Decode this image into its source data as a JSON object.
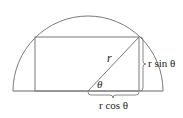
{
  "diagram": {
    "colors": {
      "stroke": "#7a7a7a",
      "text": "#222222",
      "background": "#ffffff"
    },
    "labels": {
      "radius": "r",
      "angle": "θ",
      "height": "r sin θ",
      "half_width": "r cos θ"
    },
    "geometry": {
      "semicircle_center": [
        88,
        91
      ],
      "semicircle_radius": 75,
      "rect": {
        "left": 35,
        "right": 139,
        "top": 37,
        "bottom": 91
      }
    }
  }
}
